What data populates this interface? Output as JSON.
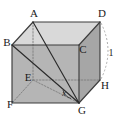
{
  "figure": {
    "type": "3d-geometry-diagram",
    "background_color": "#ffffff"
  },
  "colors": {
    "top_face": "#d6d6d6",
    "front_face": "#b4b4b4",
    "right_face": "#a8a8a8",
    "left_face": "#bdbdbd",
    "edge_solid": "#3c3c3c",
    "edge_hidden": "#8c8c8c",
    "label_text": "#1a1a1a"
  },
  "vertices": [
    {
      "id": "A",
      "label": "A",
      "x": 33,
      "y": 22,
      "label_x": 34,
      "label_y": 14
    },
    {
      "id": "B",
      "label": "B",
      "x": 12,
      "y": 45,
      "label_x": 9,
      "label_y": 43
    },
    {
      "id": "C",
      "label": "C",
      "x": 79,
      "y": 45,
      "label_x": 82,
      "label_y": 49
    },
    {
      "id": "D",
      "label": "D",
      "x": 100,
      "y": 22,
      "label_x": 102,
      "label_y": 14
    },
    {
      "id": "E",
      "label": "E",
      "x": 33,
      "y": 80,
      "label_x": 29,
      "label_y": 78
    },
    {
      "id": "F",
      "label": "F",
      "x": 12,
      "y": 103,
      "label_x": 10,
      "label_y": 104
    },
    {
      "id": "G",
      "label": "G",
      "x": 79,
      "y": 103,
      "label_x": 82,
      "label_y": 110
    },
    {
      "id": "H",
      "label": "H",
      "x": 100,
      "y": 80,
      "label_x": 104,
      "label_y": 85
    }
  ],
  "faces": [
    {
      "name": "top-face-BADC",
      "points": "12,45 33,22 100,22 79,45",
      "fill": "#d9d9d9"
    },
    {
      "name": "front-face-BCGF",
      "points": "12,45 79,45 79,103 12,103",
      "fill": "#b5b5b5"
    },
    {
      "name": "right-face-CDHG",
      "points": "79,45 100,22 100,80 79,103",
      "fill": "#a6a6a6"
    }
  ],
  "solid_edges": [
    {
      "name": "edge-B-A",
      "from": "B",
      "to": "A"
    },
    {
      "name": "edge-A-D",
      "from": "A",
      "to": "D"
    },
    {
      "name": "edge-D-C",
      "from": "D",
      "to": "C"
    },
    {
      "name": "edge-C-B",
      "from": "C",
      "to": "B"
    },
    {
      "name": "edge-B-F",
      "from": "B",
      "to": "F"
    },
    {
      "name": "edge-C-G",
      "from": "C",
      "to": "G"
    },
    {
      "name": "edge-D-H",
      "from": "D",
      "to": "H"
    },
    {
      "name": "edge-F-G",
      "from": "F",
      "to": "G"
    },
    {
      "name": "edge-G-H",
      "from": "G",
      "to": "H"
    }
  ],
  "hidden_edges": [
    {
      "name": "edge-A-E",
      "from": "A",
      "to": "E"
    },
    {
      "name": "edge-E-F",
      "from": "E",
      "to": "F"
    },
    {
      "name": "edge-E-H",
      "from": "E",
      "to": "H"
    }
  ],
  "diagonals": [
    {
      "name": "diagonal-A-G",
      "from": "A",
      "to": "G",
      "style": "solid"
    },
    {
      "name": "diagonal-B-G",
      "from": "B",
      "to": "G",
      "style": "solid"
    },
    {
      "name": "diagonal-E-G",
      "from": "E",
      "to": "G",
      "style": "hidden"
    }
  ],
  "annotations": {
    "angle_at_G": {
      "name": "angle-label-x",
      "text": "x",
      "x": 63,
      "y": 93
    },
    "length_DH": {
      "name": "dimension-label-1",
      "text": "1",
      "x": 110,
      "y": 54
    },
    "dimension_arc": {
      "name": "dimension-arc-DH",
      "description": "dashed arc from D to H"
    }
  }
}
